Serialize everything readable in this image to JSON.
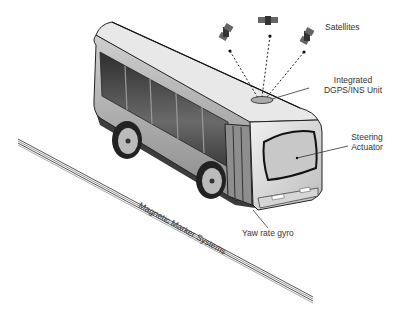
{
  "figure": {
    "labels": {
      "satellites": "Satellites",
      "dgps_line1": "Integrated",
      "dgps_line2": "DGPS/INS Unit",
      "steering_line1": "Steering",
      "steering_line2": "Actuator",
      "yaw": "Yaw rate gyro",
      "magnetic": "Magnetic Marker Systems"
    },
    "icons": [
      "satellite-icon",
      "satellite-icon",
      "satellite-icon"
    ],
    "colors": {
      "body": "#b8b8b8",
      "roof": "#e6e6e6",
      "window": "#4a4a4a",
      "outline": "#222222",
      "rail": "#777777"
    }
  }
}
